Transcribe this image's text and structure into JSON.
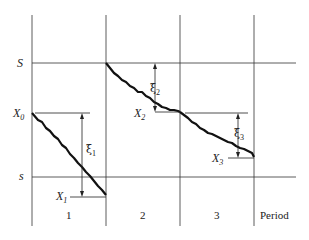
{
  "levels": {
    "upper": "S",
    "lower": "s",
    "start": "X",
    "start_sub": "0"
  },
  "periods": [
    "1",
    "2",
    "3"
  ],
  "period_label": "Period",
  "markers": [
    {
      "name": "X",
      "sub": "1",
      "demand": "ξ",
      "demand_sub": "1"
    },
    {
      "name": "X",
      "sub": "2",
      "demand": "ξ",
      "demand_sub": "2"
    },
    {
      "name": "X",
      "sub": "3",
      "demand": "ξ",
      "demand_sub": "3"
    }
  ]
}
